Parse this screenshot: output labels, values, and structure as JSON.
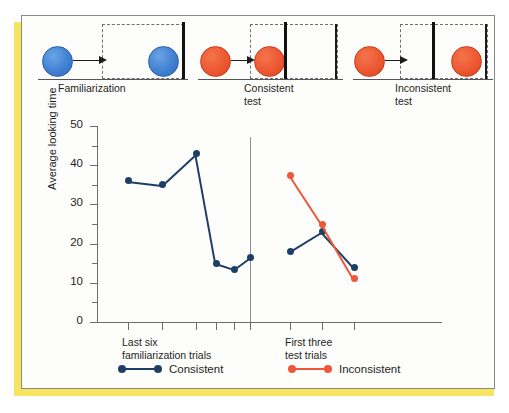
{
  "figure": {
    "accent_color": "#f7e463",
    "frame_color": "#8a8a84"
  },
  "schematic": {
    "panels": [
      {
        "id": "familiarization",
        "caption_line1": "Familiarization",
        "caption_line2": "",
        "ball_color_name": "blue",
        "ball_color": "#3f7fd1",
        "wall_position": "far-right",
        "ball_rest": "at-wall-inside-occluder"
      },
      {
        "id": "consistent-test",
        "caption_line1": "Consistent",
        "caption_line2": "test",
        "ball_color_name": "red",
        "ball_color": "#ec5630",
        "wall_position": "near-left",
        "ball_rest": "stops-before-wall"
      },
      {
        "id": "inconsistent-test",
        "caption_line1": "Inconsistent",
        "caption_line2": "test",
        "ball_color_name": "red",
        "ball_color": "#ec5630",
        "wall_position": "near-left",
        "ball_rest": "appears-beyond-wall"
      }
    ]
  },
  "chart_data": {
    "type": "line",
    "title": "",
    "xlabel": "",
    "ylabel": "Average looking time",
    "ylim": [
      0,
      50
    ],
    "ytick_labels": [
      "0",
      "10",
      "20",
      "30",
      "40",
      "50"
    ],
    "ytick_values": [
      0,
      10,
      20,
      30,
      40,
      50
    ],
    "yminor_values": [
      5,
      15,
      25,
      35,
      45
    ],
    "grid": false,
    "legend_position": "bottom",
    "panels": [
      {
        "name": "Last six familiarization trials",
        "label_line1": "Last six",
        "label_line2": "familiarization trials",
        "x": [
          1,
          2,
          3,
          4,
          5,
          6
        ],
        "series": [
          {
            "name": "Consistent",
            "color": "#1d3f66",
            "values": [
              36,
              35,
              43,
              15,
              13.5,
              16.5
            ]
          }
        ]
      },
      {
        "name": "First three test trials",
        "label_line1": "First three",
        "label_line2": "test trials",
        "x": [
          7,
          8,
          9
        ],
        "series": [
          {
            "name": "Consistent",
            "color": "#1d3f66",
            "values": [
              18,
              23,
              14
            ]
          },
          {
            "name": "Inconsistent",
            "color": "#ee573a",
            "values": [
              37.5,
              25,
              11
            ]
          }
        ]
      }
    ],
    "legend": [
      {
        "label": "Consistent",
        "color": "#1d3f66"
      },
      {
        "label": "Inconsistent",
        "color": "#ee573a"
      }
    ]
  }
}
